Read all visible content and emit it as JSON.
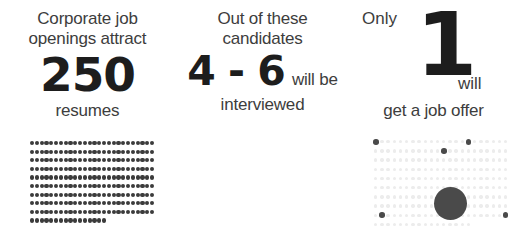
{
  "infographic": {
    "title": "Corporate hiring funnel",
    "colors": {
      "heading_text": "#3d3d3d",
      "big_number": "#1d1d1d",
      "dot_dark": "#3b3b3b",
      "dot_accent": "#4a4a4a",
      "dot_faint_middle": "#ececec",
      "dot_faint_right": "#efefef",
      "background": "#ffffff"
    },
    "panels": [
      {
        "id": "resumes",
        "lede": "Corporate job\nopenings attract",
        "big_number": "250",
        "tail": "",
        "undertext": "resumes",
        "visual": {
          "type": "dot-grid",
          "style": "all-filled",
          "columns": 26,
          "rows": 10,
          "total_dots": 250,
          "full_rows": 9,
          "last_row_count": 16,
          "dot_color": "#3b3b3b"
        }
      },
      {
        "id": "interviewed",
        "lede": "Out of these\ncandidates",
        "big_number": "4 - 6",
        "tail": "will be",
        "undertext": "interviewed",
        "visual": {
          "type": "dot-grid",
          "style": "sparse-highlight",
          "columns": 22,
          "rows": 10,
          "total_dots": 214,
          "last_row_count": 14,
          "highlight_count": 6,
          "highlight_cells": [
            {
              "row": 0,
              "col": 0
            },
            {
              "row": 1,
              "col": 11
            },
            {
              "row": 0,
              "col": 15
            },
            {
              "row": 7,
              "col": 13
            },
            {
              "row": 8,
              "col": 1
            },
            {
              "row": 8,
              "col": 21
            }
          ],
          "dot_color": "#ececec",
          "highlight_color": "#4a4a4a"
        }
      },
      {
        "id": "job-offer",
        "lede": "Only",
        "big_number": "1",
        "tail": "will",
        "undertext": "get a job offer",
        "visual": {
          "type": "dot-grid",
          "style": "faint-with-single-circle",
          "columns": 21,
          "rows": 10,
          "total_dots": 205,
          "last_row_count": 16,
          "dot_color": "#efefef",
          "circle": {
            "label": "single-hire-marker",
            "diameter_px": 33,
            "center_x": 450,
            "center_y": 203,
            "color": "#4a4a4a"
          }
        }
      }
    ]
  }
}
